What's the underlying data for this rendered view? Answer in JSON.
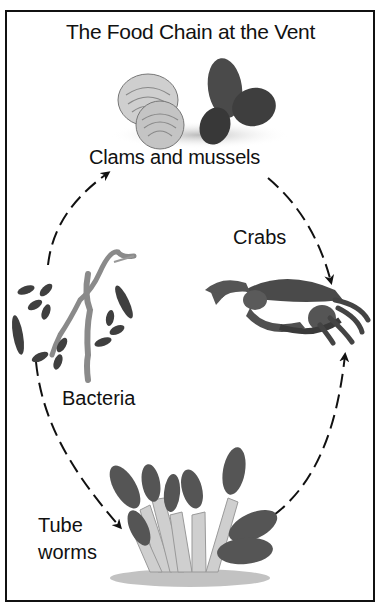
{
  "diagram": {
    "title": "The Food Chain at the Vent",
    "nodes": [
      {
        "id": "clams",
        "label": "Clams and mussels"
      },
      {
        "id": "crabs",
        "label": "Crabs"
      },
      {
        "id": "bacteria",
        "label": "Bacteria"
      },
      {
        "id": "tubeworms",
        "label_line1": "Tube",
        "label_line2": "worms"
      }
    ],
    "edges": [
      {
        "from": "bacteria",
        "to": "clams",
        "style": "dashed-arrow"
      },
      {
        "from": "clams",
        "to": "crabs",
        "style": "dashed-arrow"
      },
      {
        "from": "bacteria",
        "to": "tubeworms",
        "style": "dashed-arrow"
      },
      {
        "from": "tubeworms",
        "to": "crabs",
        "style": "dashed-arrow"
      }
    ],
    "colors": {
      "ink": "#111111",
      "dark_fill": "#3a3a3a",
      "mid_fill": "#6e6e6e",
      "light_fill": "#bdbdbd",
      "background": "#ffffff"
    }
  }
}
